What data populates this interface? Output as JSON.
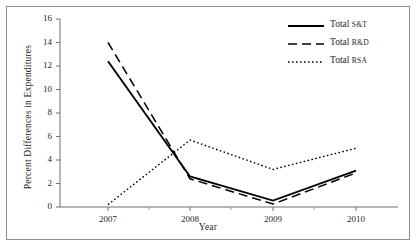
{
  "chart_data": {
    "type": "line",
    "title": "",
    "xlabel": "Year",
    "ylabel": "Percent Differences in Expenditures",
    "categories": [
      "2007",
      "2008",
      "2009",
      "2010"
    ],
    "x": [
      2007,
      2008,
      2009,
      2010
    ],
    "ylim": [
      0,
      16
    ],
    "yticks": [
      0,
      2,
      4,
      6,
      8,
      10,
      12,
      14,
      16
    ],
    "ytick_labels": [
      "0",
      "2",
      "4",
      "6",
      "8",
      "10",
      "12",
      "14",
      "16"
    ],
    "xtick_labels": [
      "2007",
      "2008",
      "2009",
      "2010"
    ],
    "grid": false,
    "legend_position": "top-right",
    "series": [
      {
        "name": "Total S&T",
        "label_word": "Total",
        "label_abbr": "S&T",
        "style": "solid",
        "color": "#000000",
        "values": [
          12.4,
          2.6,
          0.55,
          3.1
        ]
      },
      {
        "name": "Total R&D",
        "label_word": "Total",
        "label_abbr": "R&D",
        "style": "dashed",
        "color": "#000000",
        "values": [
          14.0,
          2.4,
          0.25,
          2.9
        ]
      },
      {
        "name": "Total RSA",
        "label_word": "Total",
        "label_abbr": "RSA",
        "style": "dotted",
        "color": "#000000",
        "values": [
          0.2,
          5.7,
          3.2,
          5.0
        ]
      }
    ]
  },
  "axes": {
    "ylabel": "Percent Differences in Expenditures",
    "xlabel": "Year"
  },
  "legend": {
    "items": [
      {
        "word": "Total",
        "abbr": "S&T"
      },
      {
        "word": "Total",
        "abbr": "R&D"
      },
      {
        "word": "Total",
        "abbr": "RSA"
      }
    ]
  },
  "colors": {
    "series": "#000000",
    "axis": "#6f6f6f",
    "frame": "#8d8d8d",
    "background": "#ffffff"
  }
}
